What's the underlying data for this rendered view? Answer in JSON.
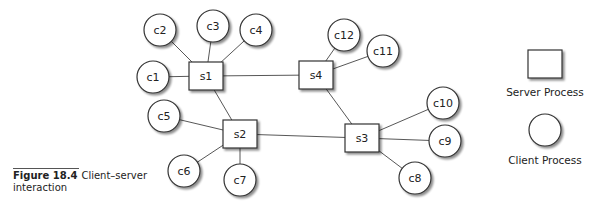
{
  "figure": {
    "number": "Figure 18.4",
    "caption": "Client–server interaction"
  },
  "legend": {
    "server_label": "Server Process",
    "client_label": "Client Process"
  },
  "servers": [
    {
      "id": "s1",
      "label": "s1",
      "x": 206,
      "y": 76
    },
    {
      "id": "s2",
      "label": "s2",
      "x": 240,
      "y": 134
    },
    {
      "id": "s3",
      "label": "s3",
      "x": 362,
      "y": 138
    },
    {
      "id": "s4",
      "label": "s4",
      "x": 316,
      "y": 75
    }
  ],
  "clients": [
    {
      "id": "c1",
      "label": "c1",
      "x": 153,
      "y": 77
    },
    {
      "id": "c2",
      "label": "c2",
      "x": 160,
      "y": 30
    },
    {
      "id": "c3",
      "label": "c3",
      "x": 213,
      "y": 26
    },
    {
      "id": "c4",
      "label": "c4",
      "x": 256,
      "y": 30
    },
    {
      "id": "c5",
      "label": "c5",
      "x": 164,
      "y": 116
    },
    {
      "id": "c6",
      "label": "c6",
      "x": 184,
      "y": 171
    },
    {
      "id": "c7",
      "label": "c7",
      "x": 240,
      "y": 180
    },
    {
      "id": "c8",
      "label": "c8",
      "x": 415,
      "y": 178
    },
    {
      "id": "c9",
      "label": "c9",
      "x": 445,
      "y": 141
    },
    {
      "id": "c10",
      "label": "c10",
      "x": 443,
      "y": 103
    },
    {
      "id": "c11",
      "label": "c11",
      "x": 383,
      "y": 51
    },
    {
      "id": "c12",
      "label": "c12",
      "x": 344,
      "y": 35
    }
  ],
  "edges": [
    [
      "s1",
      "s4"
    ],
    [
      "s1",
      "s2"
    ],
    [
      "s2",
      "s3"
    ],
    [
      "s4",
      "s3"
    ],
    [
      "s1",
      "c1"
    ],
    [
      "s1",
      "c2"
    ],
    [
      "s1",
      "c3"
    ],
    [
      "s1",
      "c4"
    ],
    [
      "s2",
      "c5"
    ],
    [
      "s2",
      "c6"
    ],
    [
      "s2",
      "c7"
    ],
    [
      "s3",
      "c8"
    ],
    [
      "s3",
      "c9"
    ],
    [
      "s3",
      "c10"
    ],
    [
      "s4",
      "c11"
    ],
    [
      "s4",
      "c12"
    ]
  ]
}
